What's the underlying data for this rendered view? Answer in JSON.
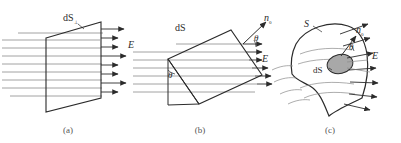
{
  "figure": {
    "background_color": "#ffffff",
    "line_color": "#2b2b2b",
    "field_line_color": "#8a8a8a",
    "patch_fill_color": "#a8a8a8",
    "label_color": "#2b2b2b",
    "caption_color": "#555555"
  },
  "panels": [
    {
      "id": "a",
      "caption": "(a)",
      "caption_x": 68,
      "caption_y": 133,
      "labels": {
        "surface": "dS",
        "surface_subscript": "⊥",
        "field": "E"
      },
      "description": "Plane surface perpendicular to uniform field E"
    },
    {
      "id": "b",
      "caption": "(b)",
      "caption_x": 200,
      "caption_y": 133,
      "labels": {
        "surface": "dS",
        "normal": "n",
        "normal_subscript": "0",
        "angle": "θ",
        "angle_2": "θ",
        "field": "E"
      },
      "description": "Tilted plane surface dS with normal n0 at angle theta to field E"
    },
    {
      "id": "c",
      "caption": "(c)",
      "caption_x": 330,
      "caption_y": 133,
      "labels": {
        "surface": "S",
        "patch": "dS",
        "normal": "n",
        "normal_subscript": "0",
        "angle": "θ",
        "field": "E"
      },
      "description": "Curved surface S with shaded element dS, normal n0 at angle theta to field E"
    }
  ]
}
